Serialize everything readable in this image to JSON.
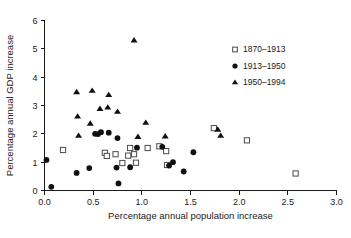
{
  "chart_data": {
    "type": "scatter",
    "title": "",
    "xlabel": "Percentage annual population increase",
    "ylabel": "Percentage annual GDP increase",
    "xlim": [
      0.0,
      3.0
    ],
    "ylim": [
      0,
      6
    ],
    "xticks": [
      "0.0",
      "0.5",
      "1.0",
      "1.5",
      "2.0",
      "2.5",
      "3.0"
    ],
    "xtick_values": [
      0.0,
      0.5,
      1.0,
      1.5,
      2.0,
      2.5,
      3.0
    ],
    "yticks": [
      "0",
      "1",
      "2",
      "3",
      "4",
      "5",
      "6"
    ],
    "ytick_values": [
      0,
      1,
      2,
      3,
      4,
      5,
      6
    ],
    "grid": false,
    "legend_position": "upper-right",
    "series": [
      {
        "name": "1870–1913",
        "marker": "open-square",
        "color": "#4a4a4a",
        "points": [
          [
            0.19,
            1.43
          ],
          [
            0.62,
            1.33
          ],
          [
            0.64,
            1.22
          ],
          [
            0.73,
            1.28
          ],
          [
            0.8,
            0.97
          ],
          [
            0.86,
            1.23
          ],
          [
            0.88,
            1.5
          ],
          [
            0.92,
            1.28
          ],
          [
            0.94,
            0.98
          ],
          [
            1.06,
            1.5
          ],
          [
            1.18,
            1.56
          ],
          [
            1.25,
            1.39
          ],
          [
            1.26,
            0.9
          ],
          [
            1.74,
            2.2
          ],
          [
            2.08,
            1.77
          ],
          [
            2.58,
            0.6
          ]
        ]
      },
      {
        "name": "1913–1950",
        "marker": "filled-circle",
        "color": "#111111",
        "points": [
          [
            0.02,
            1.08
          ],
          [
            0.07,
            0.13
          ],
          [
            0.33,
            0.62
          ],
          [
            0.46,
            0.79
          ],
          [
            0.52,
            2.0
          ],
          [
            0.55,
            1.99
          ],
          [
            0.58,
            2.06
          ],
          [
            0.66,
            2.04
          ],
          [
            0.74,
            0.81
          ],
          [
            0.75,
            1.85
          ],
          [
            0.76,
            0.25
          ],
          [
            0.88,
            0.82
          ],
          [
            0.95,
            1.51
          ],
          [
            1.21,
            1.54
          ],
          [
            1.28,
            0.88
          ],
          [
            1.32,
            1.0
          ],
          [
            1.43,
            0.67
          ],
          [
            1.53,
            1.35
          ]
        ]
      },
      {
        "name": "1950–1994",
        "marker": "filled-triangle",
        "color": "#111111",
        "points": [
          [
            0.33,
            3.47
          ],
          [
            0.34,
            2.61
          ],
          [
            0.35,
            1.93
          ],
          [
            0.47,
            2.36
          ],
          [
            0.49,
            3.52
          ],
          [
            0.57,
            2.88
          ],
          [
            0.65,
            2.93
          ],
          [
            0.66,
            3.37
          ],
          [
            0.75,
            2.78
          ],
          [
            0.92,
            5.3
          ],
          [
            0.96,
            1.89
          ],
          [
            1.04,
            2.39
          ],
          [
            1.24,
            1.91
          ],
          [
            1.78,
            2.15
          ],
          [
            1.81,
            1.93
          ]
        ]
      }
    ]
  },
  "legend": {
    "entries": [
      {
        "label": "1870–1913",
        "marker": "open-square"
      },
      {
        "label": "1913–1950",
        "marker": "filled-circle"
      },
      {
        "label": "1950–1994",
        "marker": "filled-triangle"
      }
    ]
  }
}
